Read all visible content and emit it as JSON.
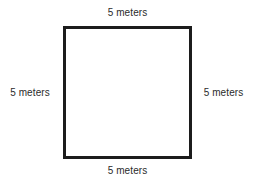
{
  "figure": {
    "type": "square-with-dimension-labels",
    "background_color": "#ffffff",
    "stroke_color": "#1c1c1c",
    "label_color": "#2b2b2b"
  },
  "labels": {
    "top": "5 meters",
    "right": "5 meters",
    "bottom": "5 meters",
    "left": "5 meters"
  },
  "chart_data": {
    "type": "diagram",
    "shape": "square",
    "title": "",
    "unit": "meters",
    "side_length": 5,
    "sides": [
      {
        "position": "top",
        "label": "5 meters",
        "value": 5
      },
      {
        "position": "right",
        "label": "5 meters",
        "value": 5
      },
      {
        "position": "bottom",
        "label": "5 meters",
        "value": 5
      },
      {
        "position": "left",
        "label": "5 meters",
        "value": 5
      }
    ]
  }
}
